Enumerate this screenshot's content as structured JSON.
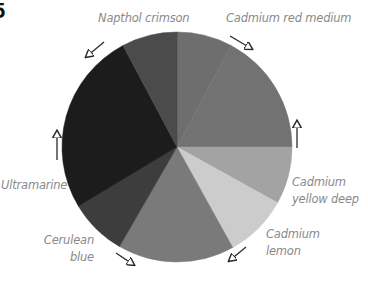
{
  "figure": {
    "number_glyph": "5"
  },
  "chart_data": {
    "type": "pie",
    "title": "",
    "center": [
      177,
      147
    ],
    "radius": 115,
    "start_angle_deg": 0,
    "direction": "clockwise",
    "slices": [
      {
        "name": "Cadmium red medium",
        "start": 0,
        "end": 28,
        "color": "#6e6e6e"
      },
      {
        "name": null,
        "start": 28,
        "end": 90,
        "color": "#727272"
      },
      {
        "name": "Cadmium yellow deep",
        "start": 90,
        "end": 119,
        "color": "#a3a3a3"
      },
      {
        "name": "Cadmium lemon",
        "start": 119,
        "end": 151,
        "color": "#cccccc"
      },
      {
        "name": null,
        "start": 151,
        "end": 210,
        "color": "#7a7a7a"
      },
      {
        "name": "Cerulean blue",
        "start": 210,
        "end": 239,
        "color": "#3d3d3d"
      },
      {
        "name": "Ultramarine",
        "start": 239,
        "end": 332,
        "color": "#1c1c1c"
      },
      {
        "name": "Napthol crimson",
        "start": 332,
        "end": 360,
        "color": "#4b4b4b"
      }
    ],
    "arrows": [
      {
        "near": "Napthol crimson",
        "from": [
          104,
          42
        ],
        "to": [
          86,
          57
        ]
      },
      {
        "near": "Cadmium red medium",
        "from": [
          230,
          36
        ],
        "to": [
          252,
          49
        ]
      },
      {
        "near": "Ultramarine",
        "from": [
          57,
          160
        ],
        "to": [
          57,
          131
        ]
      },
      {
        "near": "Cadmium yellow deep",
        "from": [
          297,
          148
        ],
        "to": [
          297,
          121
        ]
      },
      {
        "near": "Cerulean blue",
        "from": [
          116,
          253
        ],
        "to": [
          134,
          265
        ]
      },
      {
        "near": "Cadmium lemon",
        "from": [
          246,
          247
        ],
        "to": [
          229,
          261
        ]
      }
    ]
  },
  "labels": {
    "napthol_crimson": [
      "Napthol crimson"
    ],
    "cadmium_red_medium": [
      "Cadmium red medium"
    ],
    "ultramarine": [
      "Ultramarine"
    ],
    "cadmium_yellow_deep": [
      "Cadmium",
      "yellow deep"
    ],
    "cerulean_blue": [
      "Cerulean",
      "blue"
    ],
    "cadmium_lemon": [
      "Cadmium",
      "lemon"
    ]
  },
  "colors": {
    "label_text": "#8a8a8a",
    "arrow": "#2a2a2a"
  }
}
